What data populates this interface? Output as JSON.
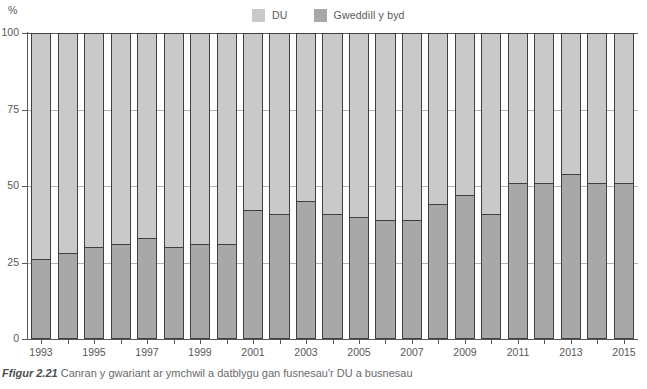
{
  "unit_label": "%",
  "legend": {
    "items": [
      {
        "label": "DU",
        "color": "#c9c9c9",
        "icon": "legend-swatch-du"
      },
      {
        "label": "Gweddill y byd",
        "color": "#a8a8a8",
        "icon": "legend-swatch-rest-of-world"
      }
    ]
  },
  "caption": {
    "prefix": "Ffigur 2.21",
    "text": "Canran y gwariant ar ymchwil a datblygu gan fusnesau'r DU a busnesau"
  },
  "chart_data": {
    "type": "bar",
    "stacked": true,
    "stack_total": 100,
    "title": "",
    "xlabel": "",
    "ylabel": "%",
    "ylim": [
      0,
      100
    ],
    "yticks": [
      0,
      25,
      50,
      75,
      100
    ],
    "ytick_labels": [
      "0",
      "25",
      "50",
      "75",
      "100"
    ],
    "grid": true,
    "legend_position": "top-center",
    "categories": [
      "1993",
      "1994",
      "1995",
      "1996",
      "1997",
      "1998",
      "1999",
      "2000",
      "2001",
      "2002",
      "2003",
      "2004",
      "2005",
      "2006",
      "2007",
      "2008",
      "2009",
      "2010",
      "2011",
      "2012",
      "2013",
      "2014",
      "2015"
    ],
    "xtick_labels": [
      "1993",
      "1995",
      "1997",
      "1999",
      "2001",
      "2003",
      "2005",
      "2007",
      "2009",
      "2011",
      "2013",
      "2015"
    ],
    "series": [
      {
        "name": "DU",
        "color": "#c9c9c9",
        "values": [
          74,
          72,
          70,
          69,
          67,
          70,
          69,
          69,
          58,
          59,
          55,
          59,
          60,
          61,
          61,
          56,
          53,
          59,
          49,
          49,
          46,
          49,
          49
        ]
      },
      {
        "name": "Gweddill y byd",
        "color": "#a8a8a8",
        "values": [
          26,
          28,
          30,
          31,
          33,
          30,
          31,
          31,
          42,
          41,
          45,
          41,
          40,
          39,
          39,
          44,
          47,
          41,
          51,
          51,
          54,
          51,
          51
        ]
      }
    ]
  }
}
